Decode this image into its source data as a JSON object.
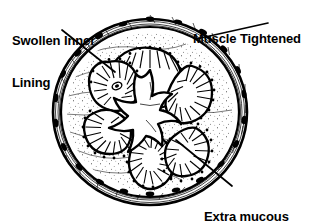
{
  "figure": {
    "name": "asthmatic-airway-cross-section",
    "style": "black and white line drawing",
    "colors": {
      "ink": "#000000",
      "background": "#ffffff"
    }
  },
  "labels": {
    "swollen_inner_lining": {
      "line1": "Swollen Inner",
      "line2": "Lining"
    },
    "muscle_tightened": {
      "line1": "Muscle Tightened"
    },
    "extra_mucous": {
      "line1": "Extra mucous",
      "line2": "Blocking the Airway"
    }
  },
  "leaders": [
    {
      "name": "leader-swollen-inner-lining",
      "from": "Swollen Inner Lining",
      "to": "epithelial lining fold"
    },
    {
      "name": "leader-muscle-tightened",
      "from": "Muscle Tightened",
      "to": "outer smooth muscle ring"
    },
    {
      "name": "leader-extra-mucous",
      "from": "Extra mucous Blocking the Airway",
      "to": "central airway lumen"
    }
  ],
  "anatomy": {
    "outer_wall": "smooth muscle ring with dark cell nuclei",
    "submucosa": "stippled connective tissue layer",
    "mucosa_lobes": 6,
    "lumen": "narrow star shaped airway opening"
  }
}
